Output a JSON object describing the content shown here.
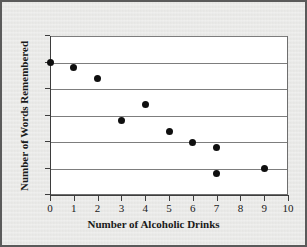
{
  "chart_data": {
    "type": "scatter",
    "title": "",
    "xlabel": "Number of Alcoholic Drinks",
    "ylabel": "Number of Words Remembered",
    "xlim": [
      0,
      10
    ],
    "ylim": [
      0,
      30
    ],
    "xticks": [
      "0",
      "1",
      "2",
      "3",
      "4",
      "5",
      "6",
      "7",
      "8",
      "9",
      "10"
    ],
    "yticks": [
      "0",
      "5",
      "10",
      "15",
      "20",
      "25",
      "30"
    ],
    "grid": "horizontal",
    "legend": "none",
    "marker": "filled-circle",
    "marker_color": "#0f0f0f",
    "points": [
      {
        "x": 0,
        "y": 25
      },
      {
        "x": 1,
        "y": 24
      },
      {
        "x": 2,
        "y": 22
      },
      {
        "x": 3,
        "y": 14
      },
      {
        "x": 4,
        "y": 17
      },
      {
        "x": 5,
        "y": 12
      },
      {
        "x": 6,
        "y": 10
      },
      {
        "x": 7,
        "y": 9
      },
      {
        "x": 7,
        "y": 4
      },
      {
        "x": 9,
        "y": 5
      }
    ]
  },
  "style": {
    "background": "#e8e8e6",
    "plot_background": "#ffffff",
    "border_color": "#5a5a5a",
    "grid_color": "#7d7d7d",
    "axis_color": "#3d3d3d"
  }
}
